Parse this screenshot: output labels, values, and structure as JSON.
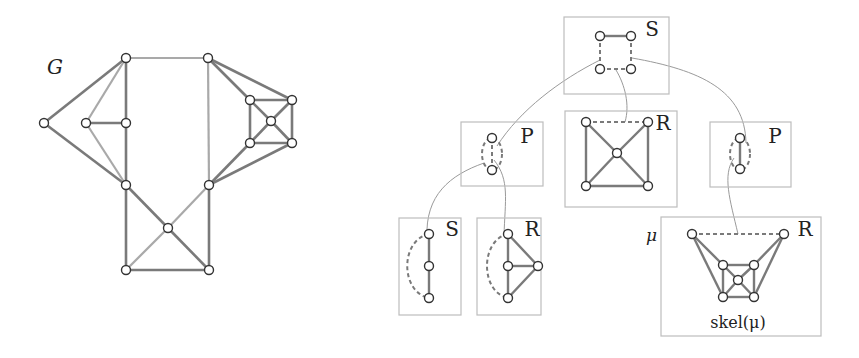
{
  "graph_G": {
    "label": "G",
    "nodes": [
      {
        "id": "a",
        "x": 126,
        "y": 58
      },
      {
        "id": "b",
        "x": 208,
        "y": 58
      },
      {
        "id": "c",
        "x": 44,
        "y": 123
      },
      {
        "id": "d",
        "x": 86,
        "y": 123
      },
      {
        "id": "e",
        "x": 126,
        "y": 123
      },
      {
        "id": "f",
        "x": 126,
        "y": 185
      },
      {
        "id": "g",
        "x": 209,
        "y": 185
      },
      {
        "id": "h",
        "x": 168,
        "y": 228
      },
      {
        "id": "i",
        "x": 126,
        "y": 270
      },
      {
        "id": "j",
        "x": 209,
        "y": 270
      },
      {
        "id": "k1",
        "x": 250,
        "y": 100
      },
      {
        "id": "k2",
        "x": 292,
        "y": 100
      },
      {
        "id": "k3",
        "x": 271,
        "y": 121
      },
      {
        "id": "k4",
        "x": 250,
        "y": 143
      },
      {
        "id": "k5",
        "x": 292,
        "y": 143
      }
    ],
    "edges": [
      [
        "a",
        "b",
        "light"
      ],
      [
        "a",
        "c",
        "dark"
      ],
      [
        "a",
        "d",
        "light"
      ],
      [
        "a",
        "e",
        "dark"
      ],
      [
        "c",
        "f",
        "dark"
      ],
      [
        "d",
        "e",
        "dark"
      ],
      [
        "d",
        "f",
        "light"
      ],
      [
        "e",
        "f",
        "dark"
      ],
      [
        "b",
        "g",
        "light"
      ],
      [
        "f",
        "i",
        "dark"
      ],
      [
        "f",
        "h",
        "dark"
      ],
      [
        "g",
        "h",
        "light"
      ],
      [
        "g",
        "j",
        "dark"
      ],
      [
        "h",
        "i",
        "light"
      ],
      [
        "h",
        "j",
        "dark"
      ],
      [
        "i",
        "j",
        "dark"
      ],
      [
        "b",
        "k1",
        "dark"
      ],
      [
        "b",
        "k2",
        "dark"
      ],
      [
        "g",
        "k4",
        "dark"
      ],
      [
        "g",
        "k5",
        "dark"
      ],
      [
        "k1",
        "k2",
        "dark"
      ],
      [
        "k1",
        "k4",
        "dark"
      ],
      [
        "k2",
        "k5",
        "dark"
      ],
      [
        "k4",
        "k5",
        "dark"
      ],
      [
        "k1",
        "k3",
        "dark"
      ],
      [
        "k2",
        "k3",
        "dark"
      ],
      [
        "k4",
        "k3",
        "dark"
      ],
      [
        "k5",
        "k3",
        "dark"
      ]
    ]
  },
  "spqr_tree": {
    "boxes": [
      {
        "id": "root-s",
        "type_label": "S",
        "x": 564,
        "y": 17,
        "w": 105,
        "h": 77,
        "label_x": 652,
        "label_y": 36,
        "nodes": [
          [
            600,
            36
          ],
          [
            631,
            36
          ],
          [
            600,
            69
          ],
          [
            631,
            69
          ]
        ],
        "edges": [
          [
            [
              600,
              36
            ],
            [
              631,
              36
            ],
            "solid"
          ],
          [
            [
              600,
              36
            ],
            [
              600,
              69
            ],
            "dashed"
          ],
          [
            [
              631,
              36
            ],
            [
              631,
              69
            ],
            "dashed"
          ],
          [
            [
              600,
              69
            ],
            [
              631,
              69
            ],
            "dashed"
          ]
        ]
      },
      {
        "id": "p-left",
        "type_label": "P",
        "x": 461,
        "y": 122,
        "w": 82,
        "h": 64,
        "label_x": 527,
        "label_y": 143,
        "nodes": [
          [
            492,
            138
          ],
          [
            492,
            170
          ]
        ],
        "edges": [
          [
            [
              492,
              138
            ],
            [
              492,
              170
            ],
            "dashed"
          ]
        ],
        "ellipse": {
          "cx": 492,
          "cy": 154,
          "rx": 10,
          "ry": 16
        }
      },
      {
        "id": "r-mid",
        "type_label": "R",
        "x": 565,
        "y": 111,
        "w": 112,
        "h": 96,
        "label_x": 663,
        "label_y": 130,
        "nodes": [
          [
            586,
            122
          ],
          [
            648,
            122
          ],
          [
            617,
            153
          ],
          [
            586,
            186
          ],
          [
            648,
            186
          ]
        ],
        "edges": [
          [
            [
              586,
              122
            ],
            [
              648,
              122
            ],
            "dashed"
          ],
          [
            [
              586,
              122
            ],
            [
              586,
              186
            ],
            "solid"
          ],
          [
            [
              648,
              122
            ],
            [
              648,
              186
            ],
            "solid"
          ],
          [
            [
              586,
              186
            ],
            [
              648,
              186
            ],
            "solid"
          ],
          [
            [
              586,
              122
            ],
            [
              617,
              153
            ],
            "solid"
          ],
          [
            [
              648,
              122
            ],
            [
              617,
              153
            ],
            "solid"
          ],
          [
            [
              586,
              186
            ],
            [
              617,
              153
            ],
            "solid"
          ],
          [
            [
              648,
              186
            ],
            [
              617,
              153
            ],
            "solid"
          ]
        ]
      },
      {
        "id": "p-right",
        "type_label": "P",
        "x": 710,
        "y": 122,
        "w": 81,
        "h": 65,
        "label_x": 775,
        "label_y": 143,
        "nodes": [
          [
            740,
            138
          ],
          [
            740,
            169
          ]
        ],
        "edges": [
          [
            [
              740,
              138
            ],
            [
              740,
              169
            ],
            "solid"
          ]
        ],
        "ellipse": {
          "cx": 740,
          "cy": 154,
          "rx": 10,
          "ry": 16
        }
      },
      {
        "id": "s-bottom",
        "type_label": "S",
        "x": 399,
        "y": 218,
        "w": 62,
        "h": 97,
        "label_x": 452,
        "label_y": 236,
        "nodes": [
          [
            429,
            234
          ],
          [
            429,
            266
          ],
          [
            429,
            298
          ]
        ],
        "edges": [
          [
            [
              429,
              234
            ],
            [
              429,
              266
            ],
            "solid"
          ],
          [
            [
              429,
              266
            ],
            [
              429,
              298
            ],
            "solid"
          ]
        ],
        "arc": "M 429 234 C 400 240, 400 292, 429 298"
      },
      {
        "id": "r-bottom-small",
        "type_label": "R",
        "x": 477,
        "y": 218,
        "w": 64,
        "h": 97,
        "label_x": 532,
        "label_y": 236,
        "nodes": [
          [
            508,
            234
          ],
          [
            508,
            266
          ],
          [
            538,
            266
          ],
          [
            508,
            298
          ]
        ],
        "edges": [
          [
            [
              508,
              234
            ],
            [
              508,
              266
            ],
            "solid"
          ],
          [
            [
              508,
              266
            ],
            [
              508,
              298
            ],
            "solid"
          ],
          [
            [
              508,
              266
            ],
            [
              538,
              266
            ],
            "solid"
          ],
          [
            [
              508,
              234
            ],
            [
              538,
              266
            ],
            "solid"
          ],
          [
            [
              508,
              298
            ],
            [
              538,
              266
            ],
            "solid"
          ]
        ],
        "arc": "M 508 234 C 480 240, 480 292, 508 298"
      },
      {
        "id": "r-bottom-large",
        "type_label": "R",
        "x": 661,
        "y": 217,
        "w": 160,
        "h": 119,
        "label_x": 805,
        "label_y": 236,
        "nodes": [
          [
            692,
            234
          ],
          [
            784,
            234
          ],
          [
            723,
            265
          ],
          [
            754,
            265
          ],
          [
            738,
            280
          ],
          [
            723,
            297
          ],
          [
            754,
            297
          ]
        ],
        "edges": [
          [
            [
              692,
              234
            ],
            [
              784,
              234
            ],
            "dashed"
          ],
          [
            [
              692,
              234
            ],
            [
              723,
              265
            ],
            "solid"
          ],
          [
            [
              692,
              234
            ],
            [
              723,
              297
            ],
            "solid"
          ],
          [
            [
              784,
              234
            ],
            [
              754,
              265
            ],
            "solid"
          ],
          [
            [
              784,
              234
            ],
            [
              754,
              297
            ],
            "solid"
          ],
          [
            [
              723,
              265
            ],
            [
              754,
              265
            ],
            "solid"
          ],
          [
            [
              723,
              265
            ],
            [
              723,
              297
            ],
            "solid"
          ],
          [
            [
              754,
              265
            ],
            [
              754,
              297
            ],
            "solid"
          ],
          [
            [
              723,
              297
            ],
            [
              754,
              297
            ],
            "solid"
          ],
          [
            [
              723,
              265
            ],
            [
              738,
              280
            ],
            "solid"
          ],
          [
            [
              754,
              265
            ],
            [
              738,
              280
            ],
            "solid"
          ],
          [
            [
              723,
              297
            ],
            [
              738,
              280
            ],
            "solid"
          ],
          [
            [
              754,
              297
            ],
            [
              738,
              280
            ],
            "solid"
          ]
        ]
      }
    ],
    "connectors": [
      "M 600 60 C 560 80, 520 110, 497 146",
      "M 616 70 C 625 85, 630 105, 625 122",
      "M 632 58 C 700 70, 745 90, 746 143",
      "M 484 163 C 450 175, 425 195, 427 238",
      "M 494 160 C 510 180, 505 200, 504 236",
      "M 734 158 C 722 175, 730 200, 738 234"
    ],
    "mu_label": "μ",
    "mu_x": 652,
    "mu_y": 240,
    "skel_label": "skel(μ)",
    "skel_x": 738,
    "skel_y": 327
  },
  "colors": {
    "dark_edge": "#7a7a7a",
    "light_edge": "#a9a9a9",
    "box": "#bdbdbd",
    "connector": "#9a9a9a",
    "node_stroke": "#333333",
    "text": "#222222"
  }
}
